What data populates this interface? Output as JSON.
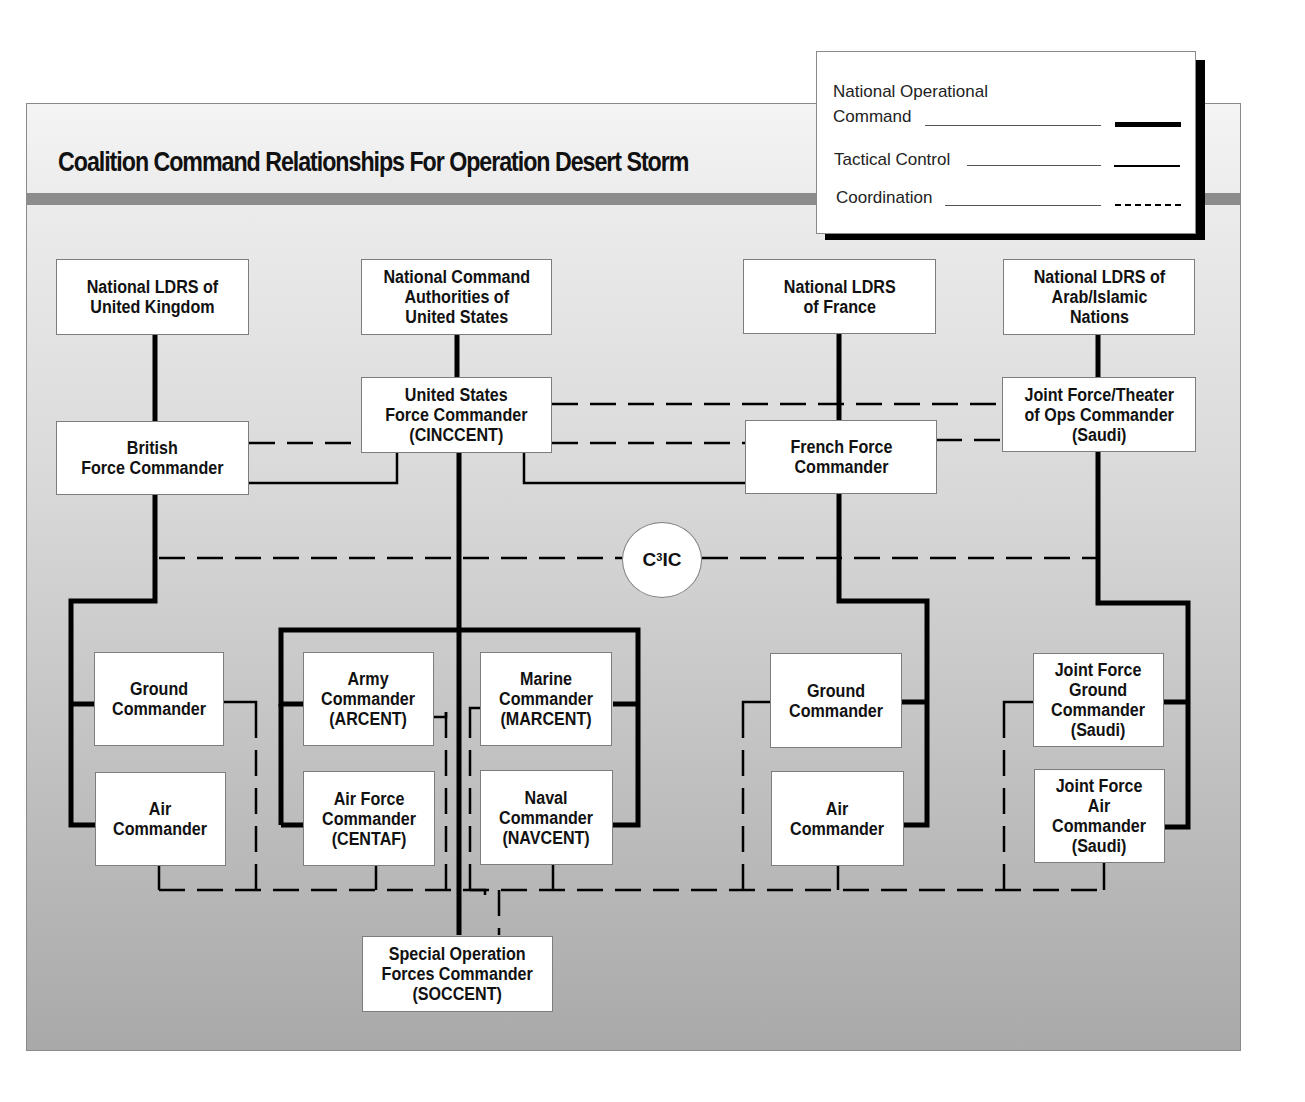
{
  "title": "Coalition Command Relationships For Operation Desert Storm",
  "legend": {
    "items": [
      {
        "label": "National Operational\nCommand",
        "line_style": "thick-solid"
      },
      {
        "label": "Tactical Control",
        "line_style": "thin-solid"
      },
      {
        "label": "Coordination",
        "line_style": "dashed"
      }
    ]
  },
  "colors": {
    "line": "#000000",
    "box_fill": "#ffffff",
    "band": "#8c8c8c",
    "panel_top": "#f4f4f4",
    "panel_bottom": "#a9a9a9"
  },
  "nodes": {
    "uk_leaders": "National LDRS of\nUnited Kingdom",
    "us_nca": "National Command\nAuthorities of\nUnited States",
    "france_leaders": "National LDRS\nof France",
    "arab_leaders": "National LDRS of\nArab/Islamic\nNations",
    "british_force": "British\nForce Commander",
    "us_force": "United States\nForce Commander\n(CINCCENT)",
    "french_force": "French Force\nCommander",
    "joint_force_theater": "Joint Force/Theater\nof Ops Commander\n(Saudi)",
    "c3ic": "C",
    "c3ic_sup": "3",
    "c3ic_suffix": "IC",
    "uk_ground": "Ground\nCommander",
    "uk_air": "Air\nCommander",
    "us_army": "Army\nCommander\n(ARCENT)",
    "us_airforce": "Air Force\nCommander\n(CENTAF)",
    "us_marine": "Marine\nCommander\n(MARCENT)",
    "us_naval": "Naval\nCommander\n(NAVCENT)",
    "fr_ground": "Ground\nCommander",
    "fr_air": "Air\nCommander",
    "jf_ground": "Joint Force\nGround\nCommander\n(Saudi)",
    "jf_air": "Joint Force\nAir\nCommander\n(Saudi)",
    "soccent": "Special Operation\nForces Commander\n(SOCCENT)"
  }
}
